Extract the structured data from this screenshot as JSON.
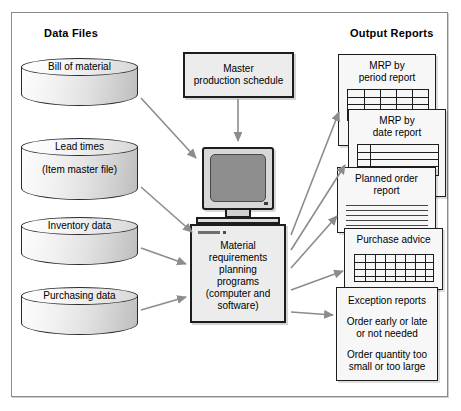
{
  "diagram": {
    "headers": {
      "data_files": "Data Files",
      "output_reports": "Output Reports"
    },
    "colors": {
      "frame_border": "#8a8a8a",
      "shape_border": "#1d1d1d",
      "box_fill": "#ececec",
      "report_fill": "#f7f7f7",
      "screen_fill": "#8e8e8e",
      "arrow": "#8c8c8c"
    },
    "data_files": [
      {
        "label": "Bill of material",
        "sublabel": ""
      },
      {
        "label": "Lead times",
        "sublabel": "(Item master file)"
      },
      {
        "label": "Inventory data",
        "sublabel": ""
      },
      {
        "label": "Purchasing data",
        "sublabel": ""
      }
    ],
    "master_schedule": {
      "line1": "Master",
      "line2": "production schedule"
    },
    "processor": {
      "line1": "Material",
      "line2": "requirements",
      "line3": "planning",
      "line4": "programs",
      "line5": "(computer and",
      "line6": "software)"
    },
    "output_reports": [
      {
        "title_line1": "MRP by",
        "title_line2": "period report",
        "body": "grid"
      },
      {
        "title_line1": "MRP by",
        "title_line2": "date report",
        "body": "grid"
      },
      {
        "title_line1": "Planned order",
        "title_line2": "report",
        "body": "lines"
      },
      {
        "title_line1": "Purchase advice",
        "title_line2": "",
        "body": "grid"
      },
      {
        "title_line1": "Exception reports",
        "title_line2": "",
        "body": "text",
        "text_lines": [
          "Order early or late",
          "or not needed",
          "Order quantity too",
          "small or too large"
        ]
      }
    ]
  }
}
